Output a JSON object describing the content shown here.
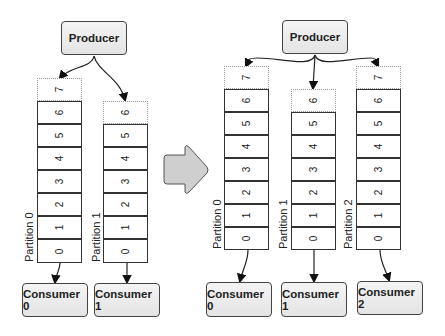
{
  "diagram": {
    "colors": {
      "box_fill": "#e8e8e8",
      "stroke": "#333333",
      "arrow_fill": "#cccccc"
    },
    "before": {
      "producer": "Producer",
      "partitions": [
        {
          "label": "Partition 0",
          "offsets": [
            "0",
            "1",
            "2",
            "3",
            "4",
            "5",
            "6"
          ],
          "pending": "7"
        },
        {
          "label": "Partition 1",
          "offsets": [
            "0",
            "1",
            "2",
            "3",
            "4",
            "5"
          ],
          "pending": "6"
        }
      ],
      "consumers": [
        "Consumer 0",
        "Consumer 1"
      ]
    },
    "after": {
      "producer": "Producer",
      "partitions": [
        {
          "label": "Partition 0",
          "offsets": [
            "0",
            "1",
            "2",
            "3",
            "4",
            "5",
            "6"
          ],
          "pending": "7"
        },
        {
          "label": "Partition 1",
          "offsets": [
            "0",
            "1",
            "2",
            "3",
            "4",
            "5"
          ],
          "pending": "6"
        },
        {
          "label": "Partition 2",
          "offsets": [
            "0",
            "1",
            "2",
            "3",
            "4",
            "5",
            "6"
          ],
          "pending": "7"
        }
      ],
      "consumers": [
        "Consumer 0",
        "Consumer 1",
        "Consumer 2"
      ]
    },
    "transition_icon": "right-arrow-icon"
  }
}
